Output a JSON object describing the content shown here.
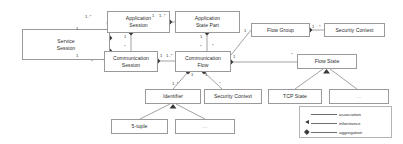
{
  "diagram": {
    "type": "uml-class-diagram",
    "canvas": {
      "width": 403,
      "height": 144
    },
    "colors": {
      "background": "#ffffff",
      "node_border": "#9a9a9a",
      "edge": "#7a7a7a",
      "text": "#2b2b2b",
      "marker": "#3a3a3a"
    },
    "nodes": [
      {
        "id": "service-session",
        "label": "Service\nSession",
        "x": 22,
        "y": 29,
        "w": 88,
        "h": 31
      },
      {
        "id": "application-session",
        "label": "Application\nSession",
        "x": 107,
        "y": 11,
        "w": 63,
        "h": 22
      },
      {
        "id": "application-state-part",
        "label": "Application\nState Part",
        "x": 175,
        "y": 11,
        "w": 65,
        "h": 22
      },
      {
        "id": "flow-group",
        "label": "Flow Group",
        "x": 251,
        "y": 23,
        "w": 59,
        "h": 14
      },
      {
        "id": "security-context-top",
        "label": "Security Context",
        "x": 324,
        "y": 23,
        "w": 61,
        "h": 14
      },
      {
        "id": "communication-session",
        "label": "Communication\nSession",
        "x": 104,
        "y": 51,
        "w": 54,
        "h": 21
      },
      {
        "id": "communication-flow",
        "label": "Communication\nFlow",
        "x": 175,
        "y": 51,
        "w": 56,
        "h": 21
      },
      {
        "id": "flow-state",
        "label": "Flow State",
        "x": 297,
        "y": 54,
        "w": 60,
        "h": 15
      },
      {
        "id": "identifier",
        "label": "Identifier",
        "x": 145,
        "y": 89,
        "w": 56,
        "h": 15
      },
      {
        "id": "security-context-mid",
        "label": "Security Context",
        "x": 204,
        "y": 89,
        "w": 58,
        "h": 15
      },
      {
        "id": "tcp-state",
        "label": "TCP State",
        "x": 268,
        "y": 89,
        "w": 54,
        "h": 15
      },
      {
        "id": "flow-state-other",
        "label": "...",
        "x": 329,
        "y": 89,
        "w": 60,
        "h": 15,
        "ellipsis": true
      },
      {
        "id": "five-tuple",
        "label": "5-tuple",
        "x": 111,
        "y": 119,
        "w": 57,
        "h": 15
      },
      {
        "id": "identifier-other",
        "label": "...",
        "x": 175,
        "y": 119,
        "w": 60,
        "h": 15,
        "ellipsis": true
      }
    ],
    "multiplicities": [
      {
        "id": "m1",
        "text": "1..*",
        "x": 85,
        "y": 15
      },
      {
        "id": "m2",
        "text": "1",
        "x": 75,
        "y": 27
      },
      {
        "id": "m3",
        "text": "1",
        "x": 75,
        "y": 54
      },
      {
        "id": "m4",
        "text": "*",
        "x": 90,
        "y": 60
      },
      {
        "id": "m5",
        "text": "1",
        "x": 153,
        "y": 14
      },
      {
        "id": "m6",
        "text": "1..*",
        "x": 160,
        "y": 14
      },
      {
        "id": "m7",
        "text": "1",
        "x": 113,
        "y": 32
      },
      {
        "id": "m8",
        "text": "*",
        "x": 113,
        "y": 45
      },
      {
        "id": "m9",
        "text": "1",
        "x": 194,
        "y": 33
      },
      {
        "id": "m10",
        "text": "*",
        "x": 194,
        "y": 46
      },
      {
        "id": "m11",
        "text": "1",
        "x": 155,
        "y": 54
      },
      {
        "id": "m12",
        "text": "1..*",
        "x": 162,
        "y": 54
      },
      {
        "id": "m13",
        "text": "1",
        "x": 243,
        "y": 29
      },
      {
        "id": "m14",
        "text": "1",
        "x": 311,
        "y": 26
      },
      {
        "id": "m15",
        "text": "*",
        "x": 318,
        "y": 26
      },
      {
        "id": "m16",
        "text": "*",
        "x": 211,
        "y": 46
      },
      {
        "id": "m17",
        "text": "1",
        "x": 232,
        "y": 54
      },
      {
        "id": "m18",
        "text": "*",
        "x": 290,
        "y": 53
      },
      {
        "id": "m19",
        "text": "1",
        "x": 189,
        "y": 73
      },
      {
        "id": "m20",
        "text": "1",
        "x": 203,
        "y": 73
      },
      {
        "id": "m21",
        "text": "1..*",
        "x": 173,
        "y": 83
      },
      {
        "id": "m22",
        "text": "*",
        "x": 218,
        "y": 83
      }
    ],
    "edges": [
      {
        "id": "service-to-application-session",
        "kind": "aggregation",
        "from": "service-session",
        "to": "application-session"
      },
      {
        "id": "service-to-communication-session",
        "kind": "aggregation",
        "from": "service-session",
        "to": "communication-session"
      },
      {
        "id": "appsession-to-appstatepart",
        "kind": "aggregation",
        "from": "application-session",
        "to": "application-state-part"
      },
      {
        "id": "appsession-to-communication-session",
        "kind": "aggregation",
        "from": "application-session",
        "to": "communication-session"
      },
      {
        "id": "appstatepart-to-communication-flow",
        "kind": "aggregation",
        "from": "application-state-part",
        "to": "communication-flow"
      },
      {
        "id": "commsession-to-commflow",
        "kind": "aggregation",
        "from": "communication-session",
        "to": "communication-flow"
      },
      {
        "id": "commflow-to-flow-group",
        "kind": "association",
        "from": "communication-flow",
        "to": "flow-group"
      },
      {
        "id": "flowgroup-to-security-context",
        "kind": "aggregation",
        "from": "flow-group",
        "to": "security-context-top"
      },
      {
        "id": "commflow-to-flow-state",
        "kind": "aggregation",
        "from": "communication-flow",
        "to": "flow-state"
      },
      {
        "id": "commflow-to-identifier",
        "kind": "aggregation",
        "from": "communication-flow",
        "to": "identifier"
      },
      {
        "id": "commflow-to-security-context-mid",
        "kind": "aggregation",
        "from": "communication-flow",
        "to": "security-context-mid"
      },
      {
        "id": "flowstate-to-tcp-state",
        "kind": "inheritance",
        "from": "tcp-state",
        "to": "flow-state"
      },
      {
        "id": "flowstate-to-other",
        "kind": "inheritance",
        "from": "flow-state-other",
        "to": "flow-state"
      },
      {
        "id": "identifier-to-five-tuple",
        "kind": "inheritance",
        "from": "five-tuple",
        "to": "identifier"
      },
      {
        "id": "identifier-to-other",
        "kind": "inheritance",
        "from": "identifier-other",
        "to": "identifier"
      }
    ],
    "legend": {
      "items": [
        {
          "id": "association",
          "label": "association",
          "marker": "none"
        },
        {
          "id": "inheritance",
          "label": "inheritance",
          "marker": "triangle"
        },
        {
          "id": "aggregation",
          "label": "aggregation",
          "marker": "diamond"
        }
      ]
    }
  }
}
